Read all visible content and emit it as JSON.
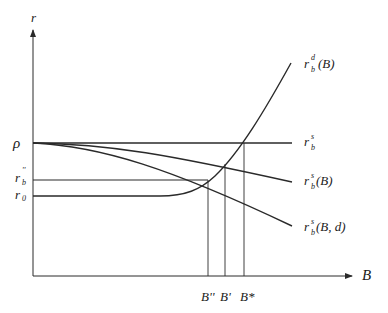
{
  "diagram": {
    "axes": {
      "y_label": "r",
      "x_label": "B"
    },
    "y_ticks": {
      "rho": "ρ",
      "rb_double_prime": {
        "base": "r",
        "sub": "b",
        "sup": "''"
      },
      "r0": {
        "base": "r",
        "sub": "0"
      }
    },
    "x_ticks": {
      "b_double_prime": "B''",
      "b_prime": "B'",
      "b_star": "B*"
    },
    "curves": {
      "demand": {
        "base": "r",
        "sub": "b",
        "sup": "d",
        "arg": "(B)"
      },
      "flat_supply": {
        "base": "r",
        "sub": "b",
        "sup": "s"
      },
      "supply": {
        "base": "r",
        "sub": "b",
        "sup": "s",
        "arg": "(B)"
      },
      "supply_d": {
        "base": "r",
        "sub": "b",
        "sup": "s",
        "arg": "(B, d)"
      }
    }
  }
}
